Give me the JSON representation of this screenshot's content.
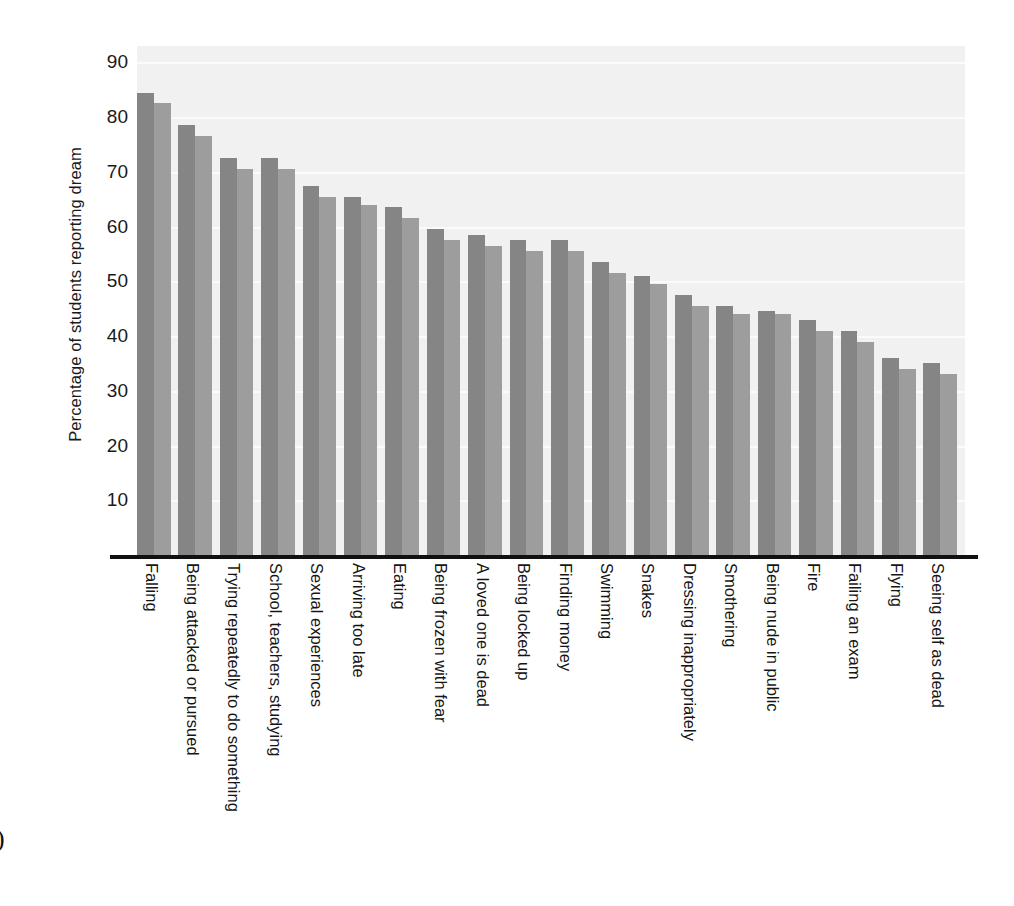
{
  "figure": {
    "artifact_mark": ")",
    "background_color": "#ffffff",
    "plot_background_color": "#f1f1f1",
    "gridline_color": "#fbfbfb",
    "axis_color": "#111111"
  },
  "chart_data": {
    "type": "bar",
    "title": "",
    "subtitle": "",
    "xlabel": "",
    "ylabel": "Percentage of students reporting dream",
    "ylim": [
      0,
      93
    ],
    "yticks": [
      10,
      20,
      30,
      40,
      50,
      60,
      70,
      80,
      90
    ],
    "grid": true,
    "legend": "none",
    "orientation": "vertical",
    "categories": [
      "Falling",
      "Being attacked or pursued",
      "Trying repeatedly to do something",
      "School, teachers, studying",
      "Sexual experiences",
      "Arriving too late",
      "Eating",
      "Being frozen with fear",
      "A loved one is dead",
      "Being locked up",
      "Finding money",
      "Swimming",
      "Snakes",
      "Dressing inappropriately",
      "Smothering",
      "Being nude in public",
      "Fire",
      "Failing an exam",
      "Flying",
      "Seeing self as dead"
    ],
    "series": [
      {
        "name": "Series 1",
        "color": "#858585",
        "values": [
          84.5,
          78.5,
          72.5,
          72.5,
          67.5,
          65.5,
          63.5,
          59.5,
          58.5,
          57.5,
          57.5,
          53.5,
          51,
          47.5,
          45.5,
          44.5,
          43,
          41,
          36,
          35
        ]
      },
      {
        "name": "Series 2",
        "color": "#9d9d9d",
        "values": [
          82.5,
          76.5,
          70.5,
          70.5,
          65.5,
          64,
          61.5,
          57.5,
          56.5,
          55.5,
          55.5,
          51.5,
          49.5,
          45.5,
          44,
          44,
          41,
          39,
          34,
          33
        ]
      }
    ]
  },
  "axis": {
    "y_tick_labels": [
      "90",
      "80",
      "70",
      "60",
      "50",
      "40",
      "30",
      "20",
      "10"
    ]
  }
}
